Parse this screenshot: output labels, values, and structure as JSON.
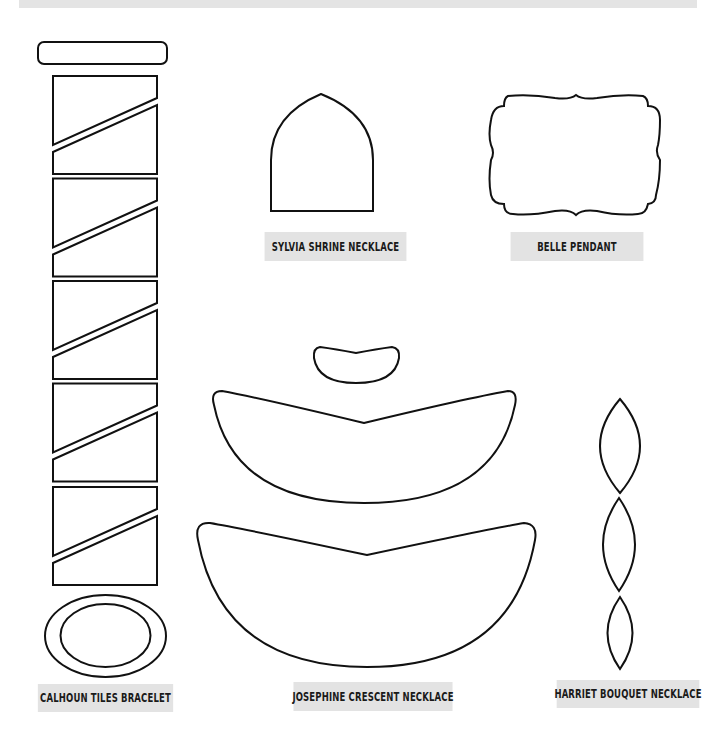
{
  "page": {
    "background": "#ffffff",
    "label_background": "#e3e3e3",
    "stroke_color": "#111111"
  },
  "templates": [
    {
      "name": "Calhoun Tiles Bracelet",
      "label": "CALHOUN TILES BRACELET",
      "pieces": [
        "rounded-bar",
        "tile-1",
        "tile-2",
        "tile-3",
        "tile-4",
        "tile-5",
        "oval-ring"
      ]
    },
    {
      "name": "Sylvia Shrine Necklace",
      "label": "SYLVIA SHRINE NECKLACE",
      "pieces": [
        "gothic-arch"
      ]
    },
    {
      "name": "Belle Pendant",
      "label": "BELLE PENDANT",
      "pieces": [
        "scalloped-frame"
      ]
    },
    {
      "name": "Josephine Crescent Necklace",
      "label": "JOSEPHINE CRESCENT NECKLACE",
      "pieces": [
        "crescent-small",
        "crescent-medium",
        "crescent-large"
      ]
    },
    {
      "name": "Harriet Bouquet Necklace",
      "label": "HARRIET BOUQUET NECKLACE",
      "pieces": [
        "leaf-large",
        "leaf-medium",
        "leaf-small"
      ]
    }
  ]
}
